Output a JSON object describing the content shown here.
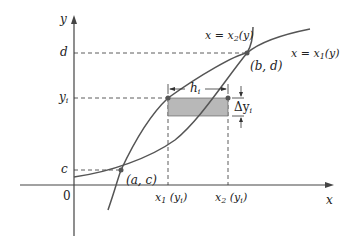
{
  "figure": {
    "type": "region-between-curves-horizontal-strip",
    "axes": {
      "x_label": "x",
      "y_label": "y",
      "origin_label": "0"
    },
    "y_ticks": {
      "d": "d",
      "y_i": "y",
      "y_i_sub": "i",
      "c": "c"
    },
    "curves": {
      "right_curve": {
        "label": "x = x",
        "sub": "2",
        "tail": "(y)"
      },
      "left_curve": {
        "label": "x = x",
        "sub": "1",
        "tail": "(y)"
      }
    },
    "points": {
      "lower": "(a, c)",
      "upper": "(b, d)"
    },
    "strip": {
      "width_label": "h",
      "width_sub": "i",
      "height_label": "Δy",
      "height_sub": "i",
      "fill_color": "#b8b8b8"
    },
    "x_ticks": {
      "x1": {
        "main": "x",
        "sub": "1",
        "arg": " (y",
        "arg_sub": "i",
        "close": ")"
      },
      "x2": {
        "main": "x",
        "sub": "2",
        "arg": " (y",
        "arg_sub": "i",
        "close": ")"
      }
    },
    "colors": {
      "curve": "#555555",
      "axis": "#444444",
      "dash": "#333333"
    }
  }
}
